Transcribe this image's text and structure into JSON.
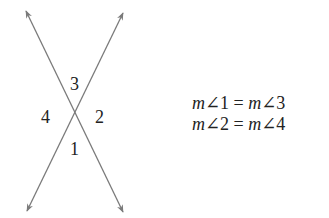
{
  "diagram": {
    "line_color": "#7a7a7a",
    "lines": [
      {
        "from": [
          26,
          11
        ],
        "to": [
          123,
          212
        ]
      },
      {
        "from": [
          123,
          13
        ],
        "to": [
          27,
          211
        ]
      }
    ],
    "intersection": [
      75,
      112
    ],
    "angle_labels": [
      {
        "id": "3",
        "text": "3",
        "x": 70,
        "y": 90
      },
      {
        "id": "4",
        "text": "4",
        "x": 41,
        "y": 123
      },
      {
        "id": "2",
        "text": "2",
        "x": 95,
        "y": 123
      },
      {
        "id": "1",
        "text": "1",
        "x": 70,
        "y": 155
      }
    ]
  },
  "equations": [
    {
      "lhs_m": "m",
      "lhs": "∠1",
      "eq": " = ",
      "rhs_m": "m",
      "rhs": "∠3"
    },
    {
      "lhs_m": "m",
      "lhs": "∠2",
      "eq": " = ",
      "rhs_m": "m",
      "rhs": "∠4"
    }
  ]
}
